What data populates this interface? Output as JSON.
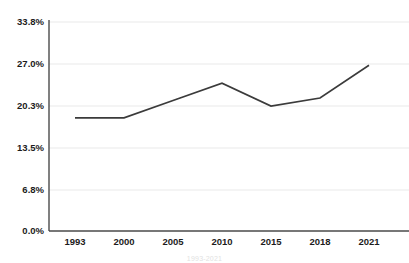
{
  "chart_data": {
    "type": "line",
    "title": "",
    "subtitle": "",
    "xlabel": "",
    "ylabel": "",
    "categories": [
      "1993",
      "2000",
      "2005",
      "2010",
      "2015",
      "2018",
      "2021"
    ],
    "values": [
      18.3,
      18.3,
      21.1,
      23.9,
      20.2,
      21.5,
      26.8
    ],
    "series": [
      {
        "name": "",
        "values": [
          18.3,
          18.3,
          21.1,
          23.9,
          20.2,
          21.5,
          26.8
        ]
      }
    ],
    "ylim": [
      0.0,
      33.8
    ],
    "yticks": [
      0.0,
      6.8,
      13.5,
      20.3,
      27.0,
      33.8
    ],
    "ytick_labels": [
      "0.0%",
      "6.8%",
      "13.5%",
      "20.3%",
      "27.0%",
      "33.8%"
    ],
    "xtick_labels": [
      "1993",
      "2000",
      "2005",
      "2010",
      "2015",
      "2018",
      "2021"
    ],
    "grid": true,
    "grid_axis": "y",
    "legend": false,
    "legend_position": "none",
    "line_color": "#3b3b3b",
    "grid_color": "#e9e9e9",
    "axis_color": "#4a4a4a",
    "text_color": "#1c1c1c",
    "background_color": "#ffffff",
    "markers": false,
    "annotations": []
  },
  "caption": {
    "text": "1993-2021"
  }
}
